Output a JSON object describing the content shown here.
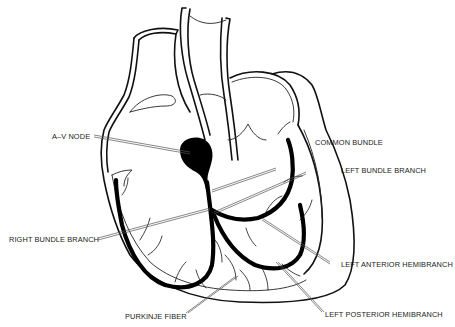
{
  "diagram": {
    "labels": {
      "av_node": "A–V NODE",
      "common_bundle": "COMMON BUNDLE",
      "left_bundle_branch": "LEFT BUNDLE BRANCH",
      "right_bundle_branch": "RIGHT BUNDLE BRANCH",
      "left_anterior_hemibranch": "LEFT ANTERIOR HEMIBRANCH",
      "left_posterior_hemibranch": "LEFT POSTERIOR HEMIBRANCH",
      "purkinje_fiber": "PURKINJE FIBER"
    },
    "colors": {
      "line": "#111111",
      "background": "#ffffff"
    }
  }
}
